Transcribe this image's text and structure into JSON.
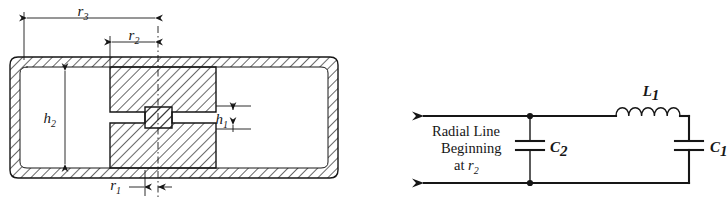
{
  "figure": {
    "name": "re-entrant-cavity-and-equivalent-circuit",
    "panels": [
      "cavity-cross-section",
      "equivalent-circuit"
    ],
    "ink_color": "#161616",
    "background_color": "#ffffff"
  },
  "cavity": {
    "dimensions": [
      {
        "id": "r3",
        "symbol": "r",
        "subscript": "3",
        "kind": "horizontal",
        "note": "outer radius, from centerline to outer wall"
      },
      {
        "id": "r2",
        "symbol": "r",
        "subscript": "2",
        "kind": "horizontal",
        "note": "post shoulder radius"
      },
      {
        "id": "r1",
        "symbol": "r",
        "subscript": "1",
        "kind": "horizontal",
        "note": "inner post radius at gap"
      },
      {
        "id": "h2",
        "symbol": "h",
        "subscript": "2",
        "kind": "vertical",
        "note": "full cavity interior height"
      },
      {
        "id": "h1",
        "symbol": "h",
        "subscript": "1",
        "kind": "vertical",
        "note": "capacitive gap height"
      }
    ]
  },
  "circuit": {
    "caption_lines": [
      "Radial Line",
      "Beginning",
      "at"
    ],
    "caption_symbol": "r",
    "caption_subscript": "2",
    "components": [
      {
        "id": "L1",
        "symbol": "L",
        "subscript": "1",
        "type": "inductor",
        "coil_loops": 5
      },
      {
        "id": "C1",
        "symbol": "C",
        "subscript": "1",
        "type": "capacitor"
      },
      {
        "id": "C2",
        "symbol": "C",
        "subscript": "2",
        "type": "capacitor"
      }
    ],
    "nodes": [
      {
        "id": "node-top",
        "type": "junction-dot"
      },
      {
        "id": "node-bottom",
        "type": "junction-dot"
      }
    ],
    "terminals": [
      {
        "id": "terminal-top",
        "type": "arrow-left"
      },
      {
        "id": "terminal-bottom",
        "type": "arrow-left"
      }
    ]
  }
}
